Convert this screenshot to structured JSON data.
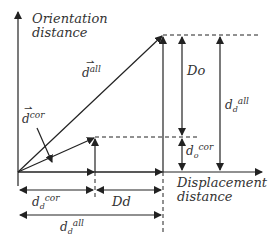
{
  "axes": {
    "y_label_line1": "Orientation",
    "y_label_line2": "distance",
    "x_label_line1": "Displacement",
    "x_label_line2": "distance"
  },
  "vectors": {
    "all": {
      "base": "d",
      "sup": "all",
      "arrow": "⇀"
    },
    "cor": {
      "base": "d",
      "sup": "cor",
      "arrow": "⇀"
    }
  },
  "labels": {
    "Do": "Do",
    "Dd": "Dd",
    "dd_all": {
      "base": "d",
      "sub": "d",
      "sup": "all"
    },
    "do_cor": {
      "base": "d",
      "sub": "o",
      "sup": "cor"
    },
    "dd_cor": {
      "base": "d",
      "sub": "d",
      "sup": "cor"
    },
    "dd_all_bottom": {
      "base": "d",
      "sub": "d",
      "sup": "all"
    }
  },
  "colors": {
    "line": "#222222",
    "text": "#333333"
  }
}
